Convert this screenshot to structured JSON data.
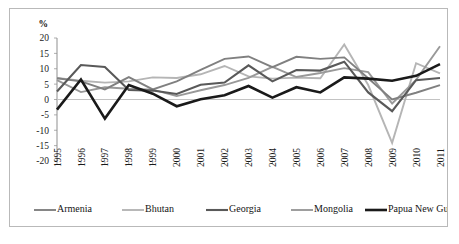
{
  "figure": {
    "unit_label": "%",
    "border_color": "#b9b9b9",
    "background": "#ffffff"
  },
  "chart_data": {
    "type": "line",
    "title": "",
    "subtitle": "",
    "xlabel": "",
    "ylabel": "%",
    "ylim": [
      -20,
      20
    ],
    "ytick_step": 5,
    "yticks": [
      "20",
      "15",
      "10",
      "5",
      "0",
      "-5",
      "-10",
      "-15",
      "-20"
    ],
    "grid": false,
    "zero_line": true,
    "legend_position": "bottom",
    "x": [
      1995,
      1996,
      1997,
      1998,
      1999,
      2000,
      2001,
      2002,
      2003,
      2004,
      2005,
      2006,
      2007,
      2008,
      2009,
      2010,
      2011
    ],
    "categories": [
      "1995",
      "1996",
      "1997",
      "1998",
      "1999",
      "2000",
      "2001",
      "2002",
      "2003",
      "2004",
      "2005",
      "2006",
      "2007",
      "2008",
      "2009",
      "2010",
      "2011"
    ],
    "series": [
      {
        "name": "Armenia",
        "color": "#808080",
        "width": 1.9,
        "values": [
          6.9,
          5.9,
          3.3,
          7.3,
          3.3,
          5.9,
          9.6,
          13.2,
          14.0,
          10.5,
          13.9,
          13.2,
          13.7,
          6.9,
          0.0,
          2.2,
          4.7
        ]
      },
      {
        "name": "Bhutan",
        "color": "#b5b5b5",
        "width": 1.9,
        "values": [
          7.0,
          6.1,
          5.5,
          5.9,
          7.2,
          7.0,
          8.2,
          10.9,
          7.5,
          6.8,
          7.1,
          6.9,
          17.9,
          4.7,
          -14.1,
          11.8,
          8.5
        ]
      },
      {
        "name": "Georgia",
        "color": "#595959",
        "width": 2.1,
        "values": [
          2.6,
          11.2,
          10.6,
          3.1,
          2.9,
          1.8,
          4.8,
          5.5,
          11.1,
          5.9,
          9.6,
          9.4,
          12.3,
          2.3,
          -3.8,
          6.3,
          7.0
        ]
      },
      {
        "name": "Mongolia",
        "color": "#999999",
        "width": 1.9,
        "values": [
          6.3,
          2.4,
          4.0,
          3.5,
          3.2,
          1.1,
          3.0,
          4.7,
          7.0,
          10.6,
          7.3,
          8.6,
          10.2,
          8.9,
          -1.3,
          6.4,
          17.3
        ]
      },
      {
        "name": "Papua New Guinea",
        "color": "#1a1a1a",
        "width": 2.6,
        "values": [
          -3.3,
          6.5,
          -6.2,
          4.7,
          1.9,
          -2.2,
          0.1,
          1.4,
          4.4,
          0.6,
          4.0,
          2.3,
          7.2,
          6.8,
          6.1,
          7.7,
          11.5
        ]
      }
    ]
  },
  "legend": {
    "items": [
      {
        "label": "Armenia",
        "color": "#808080",
        "width": 1.9
      },
      {
        "label": "Bhutan",
        "color": "#b5b5b5",
        "width": 1.9
      },
      {
        "label": "Georgia",
        "color": "#595959",
        "width": 2.1
      },
      {
        "label": "Mongolia",
        "color": "#999999",
        "width": 1.9
      },
      {
        "label": "Papua New Guinea",
        "color": "#1a1a1a",
        "width": 2.6
      }
    ]
  }
}
